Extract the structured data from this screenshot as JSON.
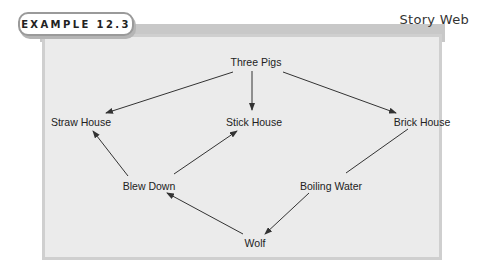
{
  "header": {
    "example_tag": "EXAMPLE 12.3",
    "title": "Story Web"
  },
  "diagram": {
    "nodes": [
      {
        "id": "three_pigs",
        "label": "Three Pigs"
      },
      {
        "id": "straw_house",
        "label": "Straw House"
      },
      {
        "id": "stick_house",
        "label": "Stick House"
      },
      {
        "id": "brick_house",
        "label": "Brick House"
      },
      {
        "id": "blew_down",
        "label": "Blew Down"
      },
      {
        "id": "boiling_water",
        "label": "Boiling Water"
      },
      {
        "id": "wolf",
        "label": "Wolf"
      }
    ],
    "edges": [
      {
        "from": "three_pigs",
        "to": "straw_house",
        "arrow": true
      },
      {
        "from": "three_pigs",
        "to": "stick_house",
        "arrow": true
      },
      {
        "from": "three_pigs",
        "to": "brick_house",
        "arrow": true
      },
      {
        "from": "blew_down",
        "to": "straw_house",
        "arrow": true
      },
      {
        "from": "blew_down",
        "to": "stick_house",
        "arrow": true
      },
      {
        "from": "wolf",
        "to": "blew_down",
        "arrow": true
      },
      {
        "from": "brick_house",
        "to": "boiling_water",
        "arrow": false
      },
      {
        "from": "boiling_water",
        "to": "wolf",
        "arrow": true
      }
    ]
  },
  "colors": {
    "panel_bg": "#ebebeb",
    "panel_border": "#cfcfcf",
    "line": "#333333"
  }
}
